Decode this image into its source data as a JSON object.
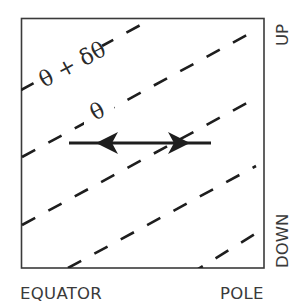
{
  "diagram": {
    "type": "isentrope-schematic",
    "frame": {
      "x": 21,
      "y": 18,
      "width": 243,
      "height": 250,
      "stroke": "#3a3a3a"
    },
    "axes": {
      "bottom_left_label": "EQUATOR",
      "bottom_right_label": "POLE",
      "right_top_label": "UP",
      "right_bottom_label": "DOWN"
    },
    "surface_labels": {
      "upper": "θ + δθ",
      "lower": "θ"
    },
    "dashed_lines": [
      {
        "name": "theta-plus-dtheta-surface",
        "x1": 21,
        "y1": 90,
        "x2": 146,
        "y2": 22
      },
      {
        "name": "theta-surface",
        "x1": 22,
        "y1": 157,
        "x2": 258,
        "y2": 29
      },
      {
        "name": "surface-3",
        "x1": 22,
        "y1": 225,
        "x2": 258,
        "y2": 97
      },
      {
        "name": "surface-4",
        "x1": 68,
        "y1": 268,
        "x2": 256,
        "y2": 166
      },
      {
        "name": "surface-5",
        "x1": 200,
        "y1": 268,
        "x2": 255,
        "y2": 234
      }
    ],
    "arrow": {
      "y": 143,
      "x1": 69,
      "x2": 211,
      "head_left_x": 108,
      "head_right_x": 178,
      "meaning": "two-headed horizontal displacement"
    },
    "colors": {
      "line": "#1e1e1e",
      "text": "#3a3a3a"
    }
  }
}
